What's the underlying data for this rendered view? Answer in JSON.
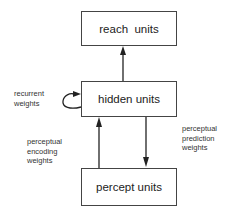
{
  "diagram": {
    "nodes": [
      {
        "id": "reach",
        "label": "reach  units"
      },
      {
        "id": "hidden",
        "label": "hidden units"
      },
      {
        "id": "percept",
        "label": "percept units"
      }
    ],
    "edges": [
      {
        "from": "hidden",
        "to": "reach",
        "label": ""
      },
      {
        "from": "hidden",
        "to": "hidden",
        "label": "recurrent weights"
      },
      {
        "from": "percept",
        "to": "hidden",
        "label": "perceptual encoding weights"
      },
      {
        "from": "hidden",
        "to": "percept",
        "label": "perceptual prediction weights"
      }
    ]
  },
  "labels": {
    "recurrent": [
      "recurrent",
      "weights"
    ],
    "encoding": [
      "perceptual",
      "encoding",
      "weights"
    ],
    "prediction": [
      "perceptual",
      "prediction",
      "weights"
    ]
  },
  "colors": {
    "stroke": "#333333",
    "text": "#222222"
  }
}
